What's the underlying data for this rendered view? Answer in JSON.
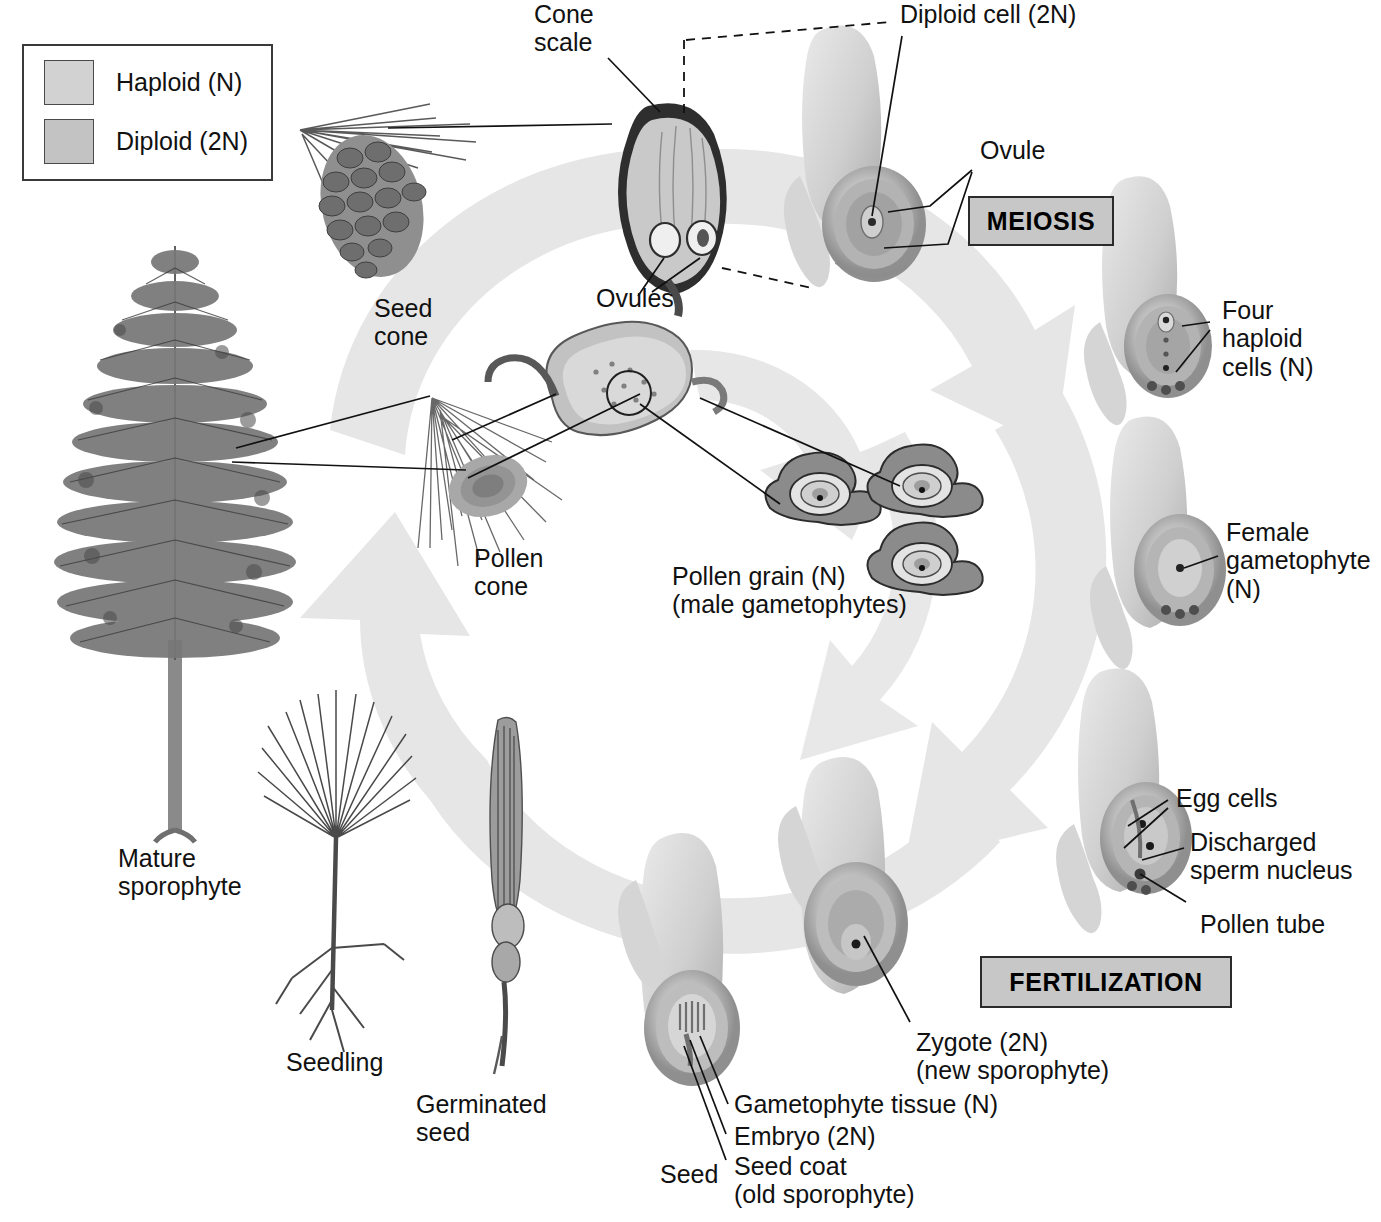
{
  "figure": {
    "type": "biological-life-cycle-diagram"
  },
  "legend": {
    "items": [
      {
        "label": "Haploid (N)",
        "swatch_color": "#d2d2d2",
        "ploidy": "N"
      },
      {
        "label": "Diploid (2N)",
        "swatch_color": "#c3c3c3",
        "ploidy": "2N"
      }
    ]
  },
  "process_boxes": [
    {
      "id": "meiosis",
      "label": "MEIOSIS",
      "fill": "#c7c7c7"
    },
    {
      "id": "fertilization",
      "label": "FERTILIZATION",
      "fill": "#c7c7c7"
    }
  ],
  "labels": {
    "cone_scale": "Cone\nscale",
    "diploid_cell": "Diploid cell (2N)",
    "ovule": "Ovule",
    "ovules": "Ovules",
    "seed_cone": "Seed\ncone",
    "four_haploid_cells": "Four\nhaploid\ncells (N)",
    "female_gametophyte": "Female\ngametophyte\n(N)",
    "pollen_cone": "Pollen\ncone",
    "pollen_grain": "Pollen grain (N)\n(male gametophytes)",
    "egg_cells": "Egg cells",
    "discharged_sperm_nucleus": "Discharged\nsperm nucleus",
    "pollen_tube": "Pollen tube",
    "zygote": "Zygote (2N)\n(new sporophyte)",
    "gametophyte_tissue": "Gametophyte tissue (N)",
    "embryo": "Embryo (2N)",
    "seed_coat": "Seed coat\n(old sporophyte)",
    "seed": "Seed",
    "germinated_seed": "Germinated\nseed",
    "seedling": "Seedling",
    "mature_sporophyte": "Mature\nsporophyte"
  },
  "stages": [
    {
      "name": "Mature sporophyte",
      "ploidy": "2N"
    },
    {
      "name": "Seed cone",
      "ploidy": "2N"
    },
    {
      "name": "Cone scale",
      "ploidy": "2N"
    },
    {
      "name": "Ovules",
      "ploidy": "2N"
    },
    {
      "name": "Diploid cell (2N)",
      "ploidy": "2N"
    },
    {
      "name": "Four haploid cells (N)",
      "ploidy": "N"
    },
    {
      "name": "Female gametophyte (N)",
      "ploidy": "N"
    },
    {
      "name": "Pollen cone",
      "ploidy": "2N"
    },
    {
      "name": "Pollen grain (N)",
      "ploidy": "N"
    },
    {
      "name": "Egg cells",
      "ploidy": "N"
    },
    {
      "name": "Zygote (2N)",
      "ploidy": "2N"
    },
    {
      "name": "Seed",
      "ploidy": "2N"
    },
    {
      "name": "Germinated seed",
      "ploidy": "2N"
    },
    {
      "name": "Seedling",
      "ploidy": "2N"
    }
  ],
  "colors": {
    "cycle_arrow": "#e6e6e6",
    "tissue_light": "#d9d9d9",
    "tissue_mid": "#bdbdbd",
    "tissue_dark": "#9a9a9a",
    "ink": "#111111"
  }
}
